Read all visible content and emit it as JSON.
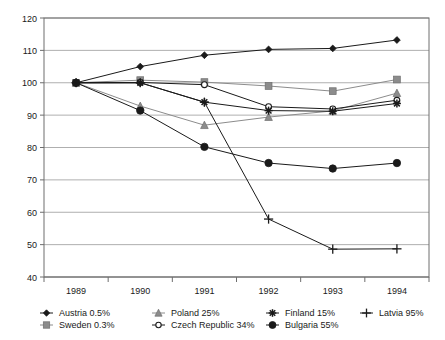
{
  "chart_data": {
    "type": "line",
    "title": "",
    "subtitle": "",
    "xlabel": "",
    "ylabel": "",
    "x": [
      1989,
      1990,
      1991,
      1992,
      1993,
      1994
    ],
    "xticklabels": [
      "1989",
      "1990",
      "1991",
      "1992",
      "1993",
      "1994"
    ],
    "yticklabels": [
      "40",
      "50",
      "60",
      "70",
      "80",
      "90",
      "100",
      "110",
      "120"
    ],
    "yticks": [
      40,
      50,
      60,
      70,
      80,
      90,
      100,
      110,
      120
    ],
    "ylim": [
      40,
      120
    ],
    "grid": "horizontal",
    "legend_position": "bottom",
    "series": [
      {
        "name": "Austria",
        "label": "Austria  0.5%",
        "share": "0.5%",
        "marker": "diamond",
        "color": "#1a1a1a",
        "values": [
          100,
          105,
          108.5,
          110.3,
          110.6,
          113.2
        ]
      },
      {
        "name": "Sweden",
        "label": "Sweden  0.3%",
        "share": "0.3%",
        "marker": "square",
        "color": "#8c8c8c",
        "values": [
          100,
          100.8,
          100.2,
          99.0,
          97.4,
          101.0
        ]
      },
      {
        "name": "Poland",
        "label": "Poland  25%",
        "share": "25%",
        "marker": "triangle",
        "color": "#8c8c8c",
        "values": [
          100,
          92.8,
          86.9,
          89.4,
          91.3,
          96.8
        ]
      },
      {
        "name": "Czech Republic",
        "label": "Czech Republic  34%",
        "share": "34%",
        "marker": "open-circle",
        "color": "#1a1a1a",
        "values": [
          100,
          100.1,
          99.4,
          92.6,
          91.9,
          94.6
        ]
      },
      {
        "name": "Finland",
        "label": "Finland  15%",
        "share": "15%",
        "marker": "asterisk",
        "color": "#1a1a1a",
        "values": [
          100,
          100.0,
          94.0,
          91.4,
          91.2,
          93.6
        ]
      },
      {
        "name": "Bulgaria",
        "label": "Bulgaria  55%",
        "share": "55%",
        "marker": "circle",
        "color": "#1a1a1a",
        "values": [
          100,
          91.4,
          80.2,
          75.2,
          73.5,
          75.2
        ]
      },
      {
        "name": "Latvia",
        "label": "Latvia  95%",
        "share": "95%",
        "marker": "plus",
        "color": "#1a1a1a",
        "values": [
          100,
          100.0,
          94.0,
          57.9,
          48.6,
          48.7
        ]
      }
    ]
  },
  "legend": {
    "rows": [
      [
        "Austria  0.5%",
        "Poland  25%",
        "Finland  15%",
        "Latvia  95%"
      ],
      [
        "Sweden  0.3%",
        "Czech Republic  34%",
        "Bulgaria  55%",
        ""
      ]
    ]
  }
}
